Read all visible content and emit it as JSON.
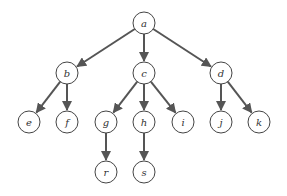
{
  "diagram": {
    "type": "tree",
    "nodes": [
      {
        "id": "a",
        "label": "a",
        "x": 144,
        "y": 23
      },
      {
        "id": "b",
        "label": "b",
        "x": 67,
        "y": 73
      },
      {
        "id": "c",
        "label": "c",
        "x": 144,
        "y": 73
      },
      {
        "id": "d",
        "label": "d",
        "x": 221,
        "y": 73
      },
      {
        "id": "e",
        "label": "e",
        "x": 29,
        "y": 122
      },
      {
        "id": "f",
        "label": "f",
        "x": 67,
        "y": 122
      },
      {
        "id": "g",
        "label": "g",
        "x": 106,
        "y": 122
      },
      {
        "id": "h",
        "label": "h",
        "x": 144,
        "y": 122
      },
      {
        "id": "i",
        "label": "i",
        "x": 183,
        "y": 122
      },
      {
        "id": "j",
        "label": "j",
        "x": 221,
        "y": 122
      },
      {
        "id": "k",
        "label": "k",
        "x": 259,
        "y": 122
      },
      {
        "id": "r",
        "label": "r",
        "x": 106,
        "y": 172
      },
      {
        "id": "s",
        "label": "s",
        "x": 144,
        "y": 172
      }
    ],
    "edges": [
      [
        "a",
        "b"
      ],
      [
        "a",
        "c"
      ],
      [
        "a",
        "d"
      ],
      [
        "b",
        "e"
      ],
      [
        "b",
        "f"
      ],
      [
        "c",
        "g"
      ],
      [
        "c",
        "h"
      ],
      [
        "c",
        "i"
      ],
      [
        "d",
        "j"
      ],
      [
        "d",
        "k"
      ],
      [
        "g",
        "r"
      ],
      [
        "h",
        "s"
      ]
    ],
    "node_radius": 11,
    "edge_color": "#555555"
  }
}
